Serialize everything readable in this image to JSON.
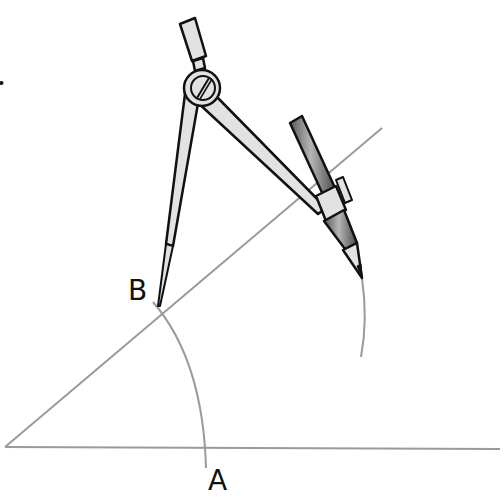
{
  "diagram": {
    "labels": {
      "point_b": "B",
      "point_a": "A"
    },
    "colors": {
      "construction_line": "#9a9a9a",
      "outline": "#111111",
      "metal_fill": "#e2e2e2",
      "pencil_dark": "#6e6e6e",
      "pencil_light": "#a8a8a8",
      "background": "#ffffff"
    },
    "elements": [
      "baseline",
      "angle-ray",
      "arc-through-a-b",
      "arc-from-pencil",
      "compass",
      "pencil"
    ]
  }
}
